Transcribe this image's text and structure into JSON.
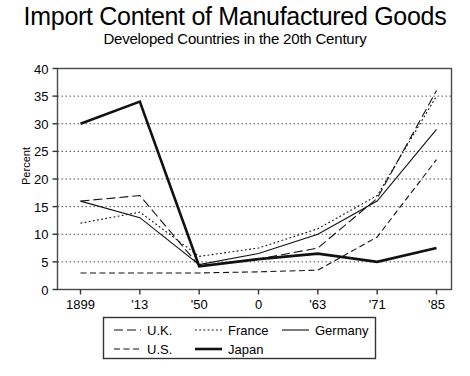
{
  "chart": {
    "title": "Import Content of Manufactured Goods",
    "subtitle": "Developed Countries in the 20th Century",
    "ylabel": "Percent"
  },
  "chart_data": {
    "type": "line",
    "title": "Import Content of Manufactured Goods",
    "subtitle": "Developed Countries in the 20th Century",
    "xlabel": "",
    "ylabel": "Percent",
    "ylim": [
      0,
      40
    ],
    "yticks": [
      0,
      5,
      10,
      15,
      20,
      25,
      30,
      35,
      40
    ],
    "categories": [
      "1899",
      "'13",
      "'50",
      "0",
      "'63",
      "'71",
      "'85"
    ],
    "grid": true,
    "legend_position": "bottom",
    "series": [
      {
        "name": "U.K.",
        "style": "long-dash",
        "values": [
          16.0,
          17.0,
          4.3,
          5.5,
          7.5,
          16.5,
          36.0
        ]
      },
      {
        "name": "U.S.",
        "style": "dashed",
        "values": [
          3.0,
          3.0,
          3.0,
          3.2,
          3.5,
          9.5,
          23.5
        ]
      },
      {
        "name": "France",
        "style": "dotted",
        "values": [
          12.0,
          14.0,
          6.0,
          7.5,
          11.0,
          17.0,
          35.0
        ]
      },
      {
        "name": "Japan",
        "style": "thick-solid",
        "values": [
          30.0,
          34.0,
          4.2,
          5.5,
          6.5,
          5.0,
          7.5
        ]
      },
      {
        "name": "Germany",
        "style": "solid",
        "values": [
          16.0,
          13.0,
          4.5,
          6.5,
          10.0,
          16.0,
          29.0
        ]
      }
    ]
  },
  "axis": {
    "ytick_labels": [
      "40",
      "35",
      "30",
      "25",
      "20",
      "15",
      "10",
      "5",
      "0"
    ],
    "xtick_labels": [
      "1899",
      "'13",
      "'50",
      "0",
      "'63",
      "'71",
      "'85"
    ]
  },
  "legend": {
    "items": [
      {
        "label": "U.K.",
        "style": "long-dash"
      },
      {
        "label": "France",
        "style": "dotted"
      },
      {
        "label": "Germany",
        "style": "solid"
      },
      {
        "label": "U.S.",
        "style": "dashed"
      },
      {
        "label": "Japan",
        "style": "thick-solid"
      }
    ]
  }
}
